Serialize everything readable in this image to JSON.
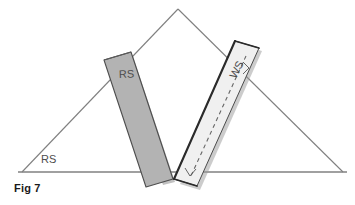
{
  "figure": {
    "caption": "Fig 7",
    "labels": {
      "roof_slope": "RS",
      "bar_left": "RS",
      "bar_right": "WS"
    },
    "colors": {
      "background": "#ffffff",
      "outline": "#808080",
      "bar_left_fill": "#b3b3b3",
      "bar_left_stroke": "#4d4d4d",
      "bar_right_fill": "#f0f0f0",
      "bar_right_stroke": "#333333",
      "dashed_line": "#666666",
      "baseline": "#808080",
      "text": "#4d4d4d",
      "caption_text": "#1a1a1a"
    },
    "geometry": {
      "triangle_apex": [
        178,
        9
      ],
      "triangle_left": [
        22,
        172
      ],
      "triangle_right": [
        343,
        172
      ],
      "baseline_y": 172,
      "bar_left_top": [
        118,
        53
      ],
      "bar_left_bottom": [
        172,
        180
      ],
      "bar_right_top": [
        248,
        44
      ],
      "bar_right_bottom": [
        188,
        182
      ]
    }
  }
}
